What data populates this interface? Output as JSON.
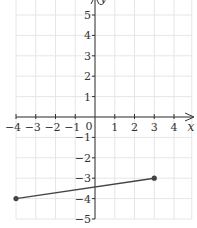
{
  "chart_data": {
    "type": "line",
    "title": "",
    "xlabel": "x",
    "ylabel": "y",
    "xlim": [
      -4,
      4.9
    ],
    "ylim": [
      -5,
      5.7
    ],
    "grid": true,
    "x_ticks": [
      -4,
      -3,
      -2,
      -1,
      1,
      2,
      3,
      4
    ],
    "y_ticks": [
      5,
      4,
      3,
      2,
      1,
      -1,
      -2,
      -3,
      -4,
      -5
    ],
    "origin_label": "0",
    "series": [
      {
        "name": "segment",
        "x": [
          -4,
          3
        ],
        "y": [
          -4,
          -3
        ],
        "endpoints": "closed"
      }
    ]
  },
  "colors": {
    "grid": "#e6e6e6",
    "axis": "#333333",
    "line": "#444444",
    "point": "#444444"
  }
}
